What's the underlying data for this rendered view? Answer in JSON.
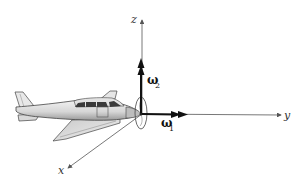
{
  "diagram": {
    "axes": {
      "x": {
        "label": "x",
        "direction": "down-left"
      },
      "y": {
        "label": "y",
        "direction": "right"
      },
      "z": {
        "label": "z",
        "direction": "up"
      }
    },
    "vectors": [
      {
        "symbol": "ω",
        "subscript": "1",
        "along": "y",
        "style": "bold double arrow"
      },
      {
        "symbol": "ω",
        "subscript": "2",
        "along": "z",
        "style": "bold double arrow"
      }
    ],
    "colors": {
      "axis": "#555555",
      "vector": "#111111",
      "fuselage": "#dcdcdc",
      "window": "#3a3a3a",
      "outline": "#444444"
    }
  }
}
